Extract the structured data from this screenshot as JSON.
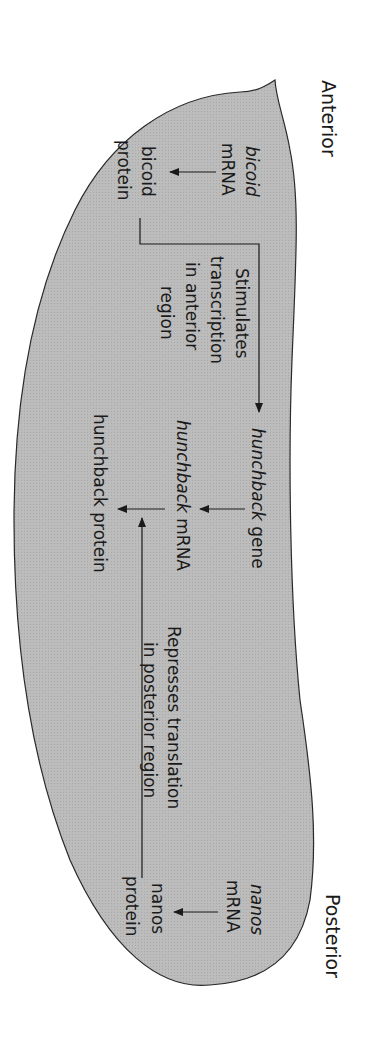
{
  "figure": {
    "orientation": "rotated 90 degrees clockwise",
    "colors": {
      "embryo_fill": "#b9b9b9",
      "outline": "#2a2a2a",
      "text": "#1a1a1a",
      "background": "#ffffff"
    },
    "axis_labels": {
      "anterior": "Anterior",
      "posterior": "Posterior"
    },
    "anterior": {
      "bicoid_mrna": {
        "line1": "bicoid",
        "line2": "mRNA"
      },
      "bicoid_protein": {
        "line1": "bicoid",
        "line2": "protein"
      },
      "stimulates": {
        "line1": "Stimulates",
        "line2": "transcription",
        "line3": "in anterior",
        "line4": "region"
      }
    },
    "center": {
      "hunchback_gene": {
        "italic": "hunchback",
        "rest": " gene"
      },
      "hunchback_mrna": {
        "italic": "hunchback",
        "rest": " mRNA"
      },
      "hunchback_protein": "hunchback protein",
      "represses": {
        "line1": "Represses translation",
        "line2": "in posterior region"
      }
    },
    "posterior": {
      "nanos_mrna": {
        "line1": "nanos",
        "line2": "mRNA"
      },
      "nanos_protein": {
        "line1": "nanos",
        "line2": "protein"
      }
    }
  }
}
